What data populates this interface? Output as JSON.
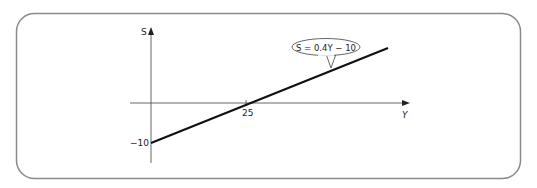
{
  "diagram": {
    "type": "line-graph",
    "axes": {
      "vertical_label": "S",
      "horizontal_label": "Y"
    },
    "ticks": {
      "x_intercept_label": "25",
      "y_intercept_label": "−10"
    },
    "line": {
      "equation_label": "S = 0.4Y − 10",
      "slope": 0.4,
      "intercept": -10,
      "x_intercept": 25
    },
    "colors": {
      "frame": "#8a8a8a",
      "axis": "#555555",
      "line": "#111111",
      "text": "#222222"
    }
  }
}
